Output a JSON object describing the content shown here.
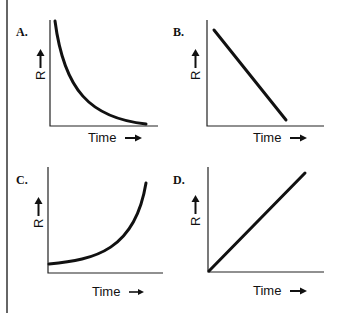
{
  "figure": {
    "panels": [
      {
        "id": "A",
        "label": "A.",
        "ylabel": "R",
        "xlabel": "Time",
        "shape": "exponential decay (concave up, decreasing)"
      },
      {
        "id": "B",
        "label": "B.",
        "ylabel": "R",
        "xlabel": "Time",
        "shape": "linear decrease"
      },
      {
        "id": "C",
        "label": "C.",
        "ylabel": "R",
        "xlabel": "Time",
        "shape": "exponential growth (concave up, increasing)"
      },
      {
        "id": "D",
        "label": "D.",
        "ylabel": "R",
        "xlabel": "Time",
        "shape": "linear increase from origin"
      }
    ],
    "arrow_glyph_right": "→",
    "arrow_glyph_up": "↑",
    "colors": {
      "line": "#111111",
      "background": "#ffffff"
    }
  }
}
